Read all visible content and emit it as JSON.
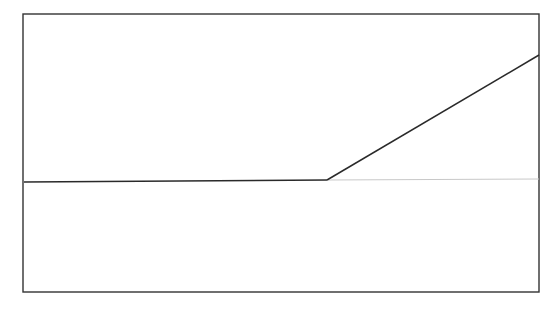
{
  "diagram": {
    "frame": {
      "x": 23,
      "y": 14,
      "width": 516,
      "height": 278,
      "stroke": "#333333"
    },
    "baseline_left": {
      "x1": 24,
      "y1": 182,
      "x2": 327,
      "y2": 180,
      "stroke": "#2a2a2a"
    },
    "rising_line": {
      "x1": 327,
      "y1": 180,
      "x2": 539,
      "y2": 55,
      "stroke": "#2a2a2a"
    },
    "baseline_right_faint": {
      "x1": 327,
      "y1": 180,
      "x2": 539,
      "y2": 179,
      "stroke": "#c8c8c8"
    }
  }
}
